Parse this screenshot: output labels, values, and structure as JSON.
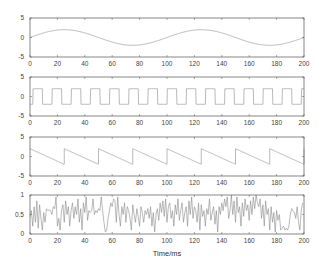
{
  "colors": {
    "axis": "#555555",
    "line": "#8a8a8a",
    "text": "#444444"
  },
  "chart_data": [
    {
      "type": "line",
      "name": "sine",
      "title": "",
      "xlabel": "",
      "ylabel": "",
      "xlim": [
        0,
        200
      ],
      "ylim": [
        -5,
        5
      ],
      "xticks": [
        0,
        20,
        40,
        60,
        80,
        100,
        120,
        140,
        160,
        180,
        200
      ],
      "yticks": [
        5,
        0,
        -5
      ],
      "ytick_labels": [
        "5",
        "0",
        "-5"
      ],
      "grid": false,
      "function": {
        "kind": "sine",
        "amplitude": 2,
        "period": 100,
        "phase": 0
      }
    },
    {
      "type": "line",
      "name": "square",
      "title": "",
      "xlabel": "",
      "ylabel": "",
      "xlim": [
        0,
        200
      ],
      "ylim": [
        -5,
        5
      ],
      "xticks": [
        0,
        20,
        40,
        60,
        80,
        100,
        120,
        140,
        160,
        180,
        200
      ],
      "yticks": [
        5,
        0,
        -5
      ],
      "ytick_labels": [
        "5",
        "0",
        "-5"
      ],
      "grid": false,
      "function": {
        "kind": "square",
        "amplitude": 2,
        "period": 14,
        "phase": 0
      }
    },
    {
      "type": "line",
      "name": "sawtooth",
      "title": "",
      "xlabel": "",
      "ylabel": "",
      "xlim": [
        0,
        200
      ],
      "ylim": [
        -5,
        5
      ],
      "xticks": [
        0,
        20,
        40,
        60,
        80,
        100,
        120,
        140,
        160,
        180,
        200
      ],
      "yticks": [
        5,
        0,
        -5
      ],
      "ytick_labels": [
        "5",
        "0",
        "-5"
      ],
      "grid": false,
      "function": {
        "kind": "sawtooth-down",
        "amplitude": 2,
        "period": 25,
        "phase": 0
      }
    },
    {
      "type": "line",
      "name": "random-noise",
      "title": "",
      "xlabel": "Time/ms",
      "ylabel": "",
      "xlim": [
        0,
        200
      ],
      "ylim": [
        0,
        1
      ],
      "xticks": [
        0,
        20,
        40,
        60,
        80,
        100,
        120,
        140,
        160,
        180,
        200
      ],
      "yticks": [
        1,
        0.5,
        0
      ],
      "ytick_labels": [
        "1",
        "0.5",
        "0"
      ],
      "grid": false,
      "x_step": 1,
      "values": [
        0.45,
        0.6,
        0.2,
        0.7,
        0.3,
        0.85,
        0.15,
        0.75,
        0.4,
        0.1,
        0.55,
        0.3,
        0.65,
        0.6,
        0.62,
        0.6,
        0.5,
        0.7,
        0.65,
        0.95,
        0.2,
        0.4,
        0.1,
        0.6,
        0.75,
        0.3,
        0.85,
        0.5,
        0.7,
        0.2,
        0.6,
        0.8,
        0.4,
        0.7,
        0.5,
        0.9,
        0.3,
        0.65,
        0.1,
        0.8,
        0.55,
        0.95,
        0.35,
        0.6,
        0.55,
        0.6,
        0.9,
        0.5,
        0.6,
        0.55,
        0.65,
        0.6,
        0.95,
        0.6,
        0.3,
        0.05,
        0.1,
        0.4,
        0.6,
        0.8,
        0.7,
        0.9,
        0.85,
        0.3,
        0.95,
        0.5,
        0.2,
        0.7,
        0.5,
        0.8,
        0.3,
        0.7,
        0.6,
        0.4,
        0.1,
        0.75,
        0.5,
        0.3,
        0.65,
        0.45,
        0.2,
        0.7,
        0.55,
        0.3,
        0.6,
        0.5,
        0.65,
        0.4,
        0.7,
        0.2,
        0.55,
        0.05,
        0.5,
        0.65,
        0.35,
        0.8,
        0.55,
        0.85,
        0.45,
        0.9,
        0.3,
        0.7,
        0.8,
        0.4,
        0.6,
        0.2,
        0.75,
        0.5,
        0.9,
        0.35,
        0.6,
        0.8,
        0.3,
        0.55,
        0.7,
        0.2,
        0.85,
        0.5,
        0.95,
        0.4,
        0.7,
        0.6,
        0.3,
        0.8,
        0.1,
        0.75,
        0.45,
        0.6,
        0.2,
        0.65,
        0.5,
        0.9,
        0.35,
        0.55,
        0.7,
        0.25,
        0.6,
        0.05,
        0.7,
        0.5,
        0.8,
        0.6,
        0.9,
        0.7,
        0.95,
        0.4,
        0.6,
        1.0,
        0.5,
        0.85,
        0.3,
        0.95,
        0.55,
        0.7,
        0.2,
        0.8,
        0.45,
        0.9,
        0.6,
        0.75,
        0.35,
        0.85,
        0.5,
        0.95,
        0.65,
        1.0,
        0.8,
        0.7,
        0.9,
        0.4,
        0.75,
        0.2,
        0.85,
        0.5,
        0.65,
        0.1,
        0.7,
        0.3,
        0.55,
        0.05,
        0.6,
        0.35,
        0.5,
        0.1,
        0.15,
        0.2,
        0.1,
        0.15,
        0.1,
        0.2,
        0.5,
        0.65,
        0.6,
        0.55,
        0.4,
        0.7,
        0.3,
        0.1,
        0.6,
        0.8
      ]
    }
  ]
}
